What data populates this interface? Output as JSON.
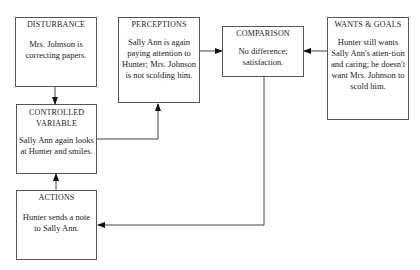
{
  "diagram": {
    "type": "control-system flowchart",
    "boxes": {
      "disturbance": {
        "title": "DISTURBANCE",
        "text": "Mrs. Johnson is correcting papers."
      },
      "perceptions": {
        "title": "PERCEPTIONS",
        "text": "Sally Ann is again paying attention to Hunter; Mrs. Johnson is not scolding him."
      },
      "comparison": {
        "title": "COMPARISON",
        "text": "No difference; satisfaction."
      },
      "wants_goals": {
        "title": "WANTS & GOALS",
        "text": "Hunter still wants Sally Ann's atten-tion and caring; he doesn't want Mrs. Johnson to scold him."
      },
      "controlled_variable": {
        "title": "CONTROLLED VARIABLE",
        "text": "Sally Ann again looks at Hunter and smiles."
      },
      "actions": {
        "title": "ACTIONS",
        "text": "Hunter sends a note to Sally Ann."
      }
    },
    "edges": [
      {
        "from": "DISTURBANCE",
        "to": "CONTROLLED VARIABLE"
      },
      {
        "from": "CONTROLLED VARIABLE",
        "to": "PERCEPTIONS"
      },
      {
        "from": "PERCEPTIONS",
        "to": "COMPARISON"
      },
      {
        "from": "WANTS & GOALS",
        "to": "COMPARISON"
      },
      {
        "from": "COMPARISON",
        "to": "ACTIONS"
      },
      {
        "from": "ACTIONS",
        "to": "CONTROLLED VARIABLE"
      }
    ],
    "colors": {
      "line": "#444444",
      "box_border": "#555555",
      "background": "#ffffff"
    }
  }
}
